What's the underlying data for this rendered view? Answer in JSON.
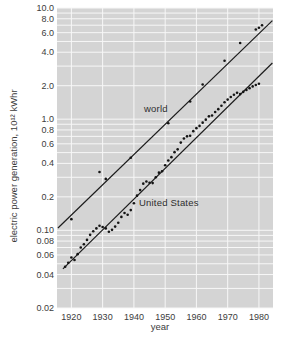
{
  "figure": {
    "plot_bg_color": "#d4d4d4",
    "grid_color": "#f7f7f7",
    "line_color": "#1c1c1c",
    "point_color": "#141414",
    "text_color": "#3c3c3c"
  },
  "chart_data": {
    "type": "scatter",
    "title": "",
    "y_scale": "log",
    "grid": "on",
    "x_axis": {
      "title": "year",
      "range": [
        1915.4,
        1984.5
      ],
      "ticks": [
        {
          "label": "1920",
          "value": 1920
        },
        {
          "label": "1930",
          "value": 1930
        },
        {
          "label": "1940",
          "value": 1940
        },
        {
          "label": "1950",
          "value": 1950
        },
        {
          "label": "1960",
          "value": 1960
        },
        {
          "label": "1970",
          "value": 1970
        },
        {
          "label": "1980",
          "value": 1980
        }
      ]
    },
    "y_axis": {
      "title": "electric power generation, 10¹² kWhr",
      "range": [
        0.02,
        10
      ],
      "ticks": [
        {
          "label": "10.0",
          "value": 10
        },
        {
          "label": "8.0",
          "value": 8
        },
        {
          "label": "6.0",
          "value": 6
        },
        {
          "label": "4.0",
          "value": 4
        },
        {
          "label": "2.0",
          "value": 2
        },
        {
          "label": "1.0",
          "value": 1
        },
        {
          "label": "0.8",
          "value": 0.8
        },
        {
          "label": "0.6",
          "value": 0.6
        },
        {
          "label": "0.4",
          "value": 0.4
        },
        {
          "label": "0.2",
          "value": 0.2
        },
        {
          "label": "0.10",
          "value": 0.1
        },
        {
          "label": "0.08",
          "value": 0.08
        },
        {
          "label": "0.06",
          "value": 0.06
        },
        {
          "label": "0.04",
          "value": 0.04
        },
        {
          "label": "0.02",
          "value": 0.02
        }
      ],
      "gridlines": [
        0.02,
        0.03,
        0.04,
        0.05,
        0.06,
        0.07,
        0.08,
        0.09,
        0.1,
        0.2,
        0.3,
        0.4,
        0.5,
        0.6,
        0.7,
        0.8,
        0.9,
        1,
        2,
        3,
        4,
        5,
        6,
        7,
        8,
        9,
        10
      ]
    },
    "series": [
      {
        "name": "world",
        "trend_line": [
          [
            1915.7,
            0.105
          ],
          [
            1984.3,
            7.7
          ]
        ],
        "points": [
          [
            1920,
            0.126
          ],
          [
            1929,
            0.335
          ],
          [
            1931,
            0.29
          ],
          [
            1939,
            0.45
          ],
          [
            1951,
            0.92
          ],
          [
            1958,
            1.44
          ],
          [
            1962,
            2.05
          ],
          [
            1969,
            3.35
          ],
          [
            1974,
            4.85
          ],
          [
            1979,
            6.4
          ],
          [
            1980,
            6.65
          ],
          [
            1981,
            7.0
          ]
        ]
      },
      {
        "name": "United States",
        "trend_line": [
          [
            1917.3,
            0.045
          ],
          [
            1984.3,
            3.2
          ]
        ],
        "points": [
          [
            1918,
            0.047
          ],
          [
            1919,
            0.051
          ],
          [
            1920,
            0.057
          ],
          [
            1921,
            0.054
          ],
          [
            1922,
            0.061
          ],
          [
            1923,
            0.07
          ],
          [
            1924,
            0.075
          ],
          [
            1925,
            0.082
          ],
          [
            1926,
            0.091
          ],
          [
            1927,
            0.098
          ],
          [
            1928,
            0.104
          ],
          [
            1929,
            0.11
          ],
          [
            1930,
            0.107
          ],
          [
            1931,
            0.104
          ],
          [
            1932,
            0.097
          ],
          [
            1933,
            0.101
          ],
          [
            1934,
            0.108
          ],
          [
            1935,
            0.117
          ],
          [
            1936,
            0.132
          ],
          [
            1937,
            0.143
          ],
          [
            1938,
            0.138
          ],
          [
            1939,
            0.152
          ],
          [
            1940,
            0.175
          ],
          [
            1941,
            0.205
          ],
          [
            1942,
            0.23
          ],
          [
            1943,
            0.263
          ],
          [
            1944,
            0.275
          ],
          [
            1945,
            0.268
          ],
          [
            1946,
            0.266
          ],
          [
            1947,
            0.3
          ],
          [
            1948,
            0.33
          ],
          [
            1949,
            0.34
          ],
          [
            1950,
            0.385
          ],
          [
            1951,
            0.425
          ],
          [
            1952,
            0.455
          ],
          [
            1953,
            0.505
          ],
          [
            1954,
            0.535
          ],
          [
            1955,
            0.615
          ],
          [
            1956,
            0.67
          ],
          [
            1957,
            0.7
          ],
          [
            1958,
            0.71
          ],
          [
            1959,
            0.78
          ],
          [
            1960,
            0.83
          ],
          [
            1961,
            0.87
          ],
          [
            1962,
            0.93
          ],
          [
            1963,
            0.99
          ],
          [
            1964,
            1.06
          ],
          [
            1965,
            1.08
          ],
          [
            1966,
            1.16
          ],
          [
            1967,
            1.23
          ],
          [
            1968,
            1.32
          ],
          [
            1969,
            1.42
          ],
          [
            1970,
            1.5
          ],
          [
            1971,
            1.58
          ],
          [
            1972,
            1.66
          ],
          [
            1973,
            1.73
          ],
          [
            1974,
            1.68
          ],
          [
            1975,
            1.76
          ],
          [
            1976,
            1.83
          ],
          [
            1977,
            1.9
          ],
          [
            1978,
            1.97
          ],
          [
            1979,
            2.03
          ],
          [
            1980,
            2.08
          ]
        ]
      }
    ]
  }
}
